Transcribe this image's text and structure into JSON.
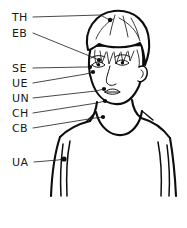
{
  "diagram": {
    "background_color": "#ffffff",
    "ink_color": "#0d0d0d",
    "label_color": "#1a1a1a",
    "width": 187,
    "height": 228,
    "labels": [
      {
        "id": "TH",
        "code": "TH",
        "meaning": "top of head",
        "label_x": 12,
        "label_y": 21,
        "leader": "M33,17 L104,15 L110,20",
        "point_x": 110,
        "point_y": 20,
        "dot_r": 2.2
      },
      {
        "id": "EB",
        "code": "EB",
        "meaning": "eyebrow",
        "label_x": 12,
        "label_y": 37,
        "leader": "M33,33 L92,56 L99,60",
        "point_x": 99,
        "point_y": 60,
        "dot_r": 2.1
      },
      {
        "id": "SE",
        "code": "SE",
        "meaning": "side of eye",
        "label_x": 12,
        "label_y": 72,
        "leader": "M33,68 L84,67 L90,67",
        "point_x": 90,
        "point_y": 67,
        "dot_r": 2.1
      },
      {
        "id": "UE",
        "code": "UE",
        "meaning": "under eye",
        "label_x": 12,
        "label_y": 87,
        "leader": "M33,83 L86,74 L93,72",
        "point_x": 93,
        "point_y": 72,
        "dot_r": 2.1
      },
      {
        "id": "UN",
        "code": "UN",
        "meaning": "under nose",
        "label_x": 12,
        "label_y": 102,
        "leader": "M33,98 L96,91 L104,89",
        "point_x": 104,
        "point_y": 89,
        "dot_r": 2.1
      },
      {
        "id": "CH",
        "code": "CH",
        "meaning": "chin",
        "label_x": 12,
        "label_y": 117,
        "leader": "M33,113 L97,103 L105,101",
        "point_x": 105,
        "point_y": 101,
        "dot_r": 2.1
      },
      {
        "id": "CB",
        "code": "CB",
        "meaning": "collar bone",
        "label_x": 12,
        "label_y": 132,
        "leader": "M33,128 L95,118 L103,117",
        "point_x": 103,
        "point_y": 117,
        "dot_r": 2.1
      },
      {
        "id": "UA",
        "code": "UA",
        "meaning": "under arm",
        "label_x": 12,
        "label_y": 166,
        "leader": "M34,162 L58,160 L64,159",
        "point_x": 64,
        "point_y": 159,
        "dot_r": 2.6
      }
    ],
    "figure": {
      "head_outline": "M92,45 C89,58 88,70 92,81 C96,93 104,101 114,102 C124,103 133,97 138,86 C143,74 144,58 142,46",
      "jaw_line": "M92,81 C95,95 105,103 115,103 C126,103 135,95 139,84",
      "hair_outline": "M88,48 C84,30 96,14 114,12 C133,10 147,22 148,40 C149,50 147,58 145,63 C144,52 142,46 140,43 C130,47 112,48 100,44 C95,46 90,48 88,48 Z",
      "hair_strokes": [
        "M100,50 L102,62 L106,52",
        "M107,51 L109,63 L113,52",
        "M114,51 L116,63 L120,52",
        "M121,51 L123,62 L127,51",
        "M128,50 L130,60 L134,50",
        "M95,49 C94,55 95,60 97,64",
        "M137,49 C139,55 140,61 139,66",
        "M112,20 C104,24 98,30 95,38",
        "M118,19 C128,23 136,31 139,40",
        "M114,16 C112,22 110,28 109,34",
        "M122,17 C124,24 126,30 127,36"
      ],
      "ear": "M139,66 C144,64 147,68 146,73 C145,78 141,81 138,80",
      "ear_inner": "M141,69 C143,70 143,74 141,76",
      "left_eye": "M93,64 C96,61 101,61 104,64 C101,67 96,67 93,64 Z",
      "right_eye": "M117,63 C120,60 125,60 128,63 C125,66 120,66 117,63 Z",
      "left_pupil_cx": 98.5,
      "left_pupil_cy": 64,
      "right_pupil_cx": 122.5,
      "right_pupil_cy": 63,
      "left_brow": "M92,58 C96,55 102,55 106,57",
      "right_brow": "M116,57 C120,54 127,54 130,57",
      "nose": "M110,66 C108,74 106,80 108,83 C110,85 113,85 115,83",
      "mouth": "M105,92 C109,89 115,89 119,92 C115,95 109,95 105,92 Z",
      "mouth_line": "M105,92 L119,92",
      "neck_left": "M97,102 C96,110 94,116 90,121",
      "neck_right": "M132,100 C133,108 136,114 141,118",
      "collar_scoop": "M96,112 C100,128 112,135 122,134 C132,133 140,124 142,112",
      "shoulder_left": "M90,121 C78,124 68,129 60,137",
      "shoulder_right": "M141,118 C152,121 162,127 170,138",
      "strap_left": "M96,112 C92,116 89,119 86,121",
      "strap_right": "M142,112 C146,115 149,117 152,119",
      "torso_left": "M60,137 C55,152 52,172 51,196",
      "torso_right": "M170,138 C173,155 175,175 176,196",
      "arm_left_outer": "M60,137 C56,155 55,175 56,196",
      "arm_left_inner": "M70,139 C67,154 66,172 67,196",
      "arm_right_inner": "M158,140 C161,156 162,174 161,196",
      "tank_edge_left": "M68,140 C66,158 65,178 66,196",
      "tank_edge_right": "M160,141 C162,158 163,178 162,196",
      "body_side_left": "M64,146 C62,162 61,180 62,196",
      "body_side_right": "M166,147 C168,163 169,181 168,196"
    }
  }
}
